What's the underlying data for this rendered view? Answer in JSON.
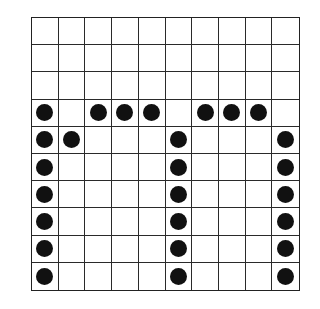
{
  "grid": {
    "rows": 10,
    "cols": 10,
    "line_color": "#2a2a2a",
    "dot_color": "#111111",
    "dots": [
      [
        3,
        0
      ],
      [
        3,
        2
      ],
      [
        3,
        3
      ],
      [
        3,
        4
      ],
      [
        3,
        6
      ],
      [
        3,
        7
      ],
      [
        3,
        8
      ],
      [
        4,
        0
      ],
      [
        4,
        1
      ],
      [
        4,
        5
      ],
      [
        4,
        9
      ],
      [
        5,
        0
      ],
      [
        5,
        5
      ],
      [
        5,
        9
      ],
      [
        6,
        0
      ],
      [
        6,
        5
      ],
      [
        6,
        9
      ],
      [
        7,
        0
      ],
      [
        7,
        5
      ],
      [
        7,
        9
      ],
      [
        8,
        0
      ],
      [
        8,
        5
      ],
      [
        8,
        9
      ],
      [
        9,
        0
      ],
      [
        9,
        5
      ],
      [
        9,
        9
      ]
    ]
  }
}
